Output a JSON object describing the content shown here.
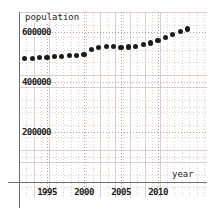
{
  "chart_data": {
    "type": "scatter",
    "title": "",
    "xlabel": "year",
    "ylabel": "population",
    "xlim": [
      1990.5,
      2014.5
    ],
    "ylim": [
      0,
      660000
    ],
    "grid": true,
    "legend": null,
    "x_ticks": [
      "1995",
      "2000",
      "2005",
      "2010"
    ],
    "x_tick_values": [
      1995,
      2000,
      2005,
      2010
    ],
    "y_ticks": [
      "200000",
      "400000",
      "600000"
    ],
    "y_tick_values": [
      200000,
      400000,
      600000
    ],
    "marker_color": "#1c1c1c",
    "grid_color": "#be9696",
    "axis_color": "#6f6f6f",
    "x": [
      1991,
      1992,
      1993,
      1994,
      1995,
      1996,
      1997,
      1998,
      1999,
      2000,
      2001,
      2002,
      2003,
      2004,
      2005,
      2006,
      2007,
      2008,
      2009,
      2010,
      2011,
      2012,
      2013,
      2014
    ],
    "values": [
      491000,
      493000,
      495000,
      497000,
      499000,
      501000,
      503000,
      505000,
      507000,
      509000,
      531000,
      537000,
      541000,
      543000,
      539000,
      540000,
      543000,
      549000,
      556000,
      566000,
      577000,
      591000,
      601000,
      612000
    ],
    "series": [
      {
        "name": "population",
        "values": [
          491000,
          493000,
          495000,
          497000,
          499000,
          501000,
          503000,
          505000,
          507000,
          509000,
          531000,
          537000,
          541000,
          543000,
          539000,
          540000,
          543000,
          549000,
          556000,
          566000,
          577000,
          591000,
          601000,
          612000
        ]
      }
    ]
  },
  "axes": {
    "y_title": "population",
    "x_title": "year"
  }
}
